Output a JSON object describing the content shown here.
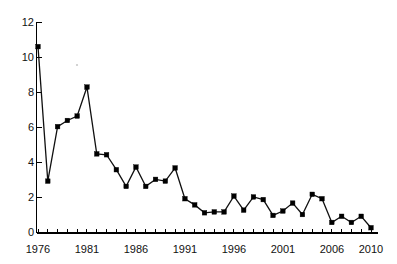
{
  "chart_data": {
    "type": "line",
    "title": "",
    "subtitle": "",
    "xlabel": "",
    "ylabel": "",
    "xlim": [
      1975.4,
      2010.6
    ],
    "ylim": [
      0,
      12
    ],
    "grid": false,
    "legend": null,
    "marker": "square",
    "line_color": "#101010",
    "marker_color": "#000000",
    "y_ticks": [
      0,
      2,
      4,
      6,
      8,
      10,
      12
    ],
    "y_tick_labels": [
      "0",
      "2",
      "4",
      "6",
      "8",
      "10",
      "12"
    ],
    "x_ticks": [
      1976,
      1977,
      1978,
      1979,
      1980,
      1981,
      1982,
      1983,
      1984,
      1985,
      1986,
      1987,
      1988,
      1989,
      1990,
      1991,
      1992,
      1993,
      1994,
      1995,
      1996,
      1997,
      1998,
      1999,
      2000,
      2001,
      2002,
      2003,
      2004,
      2005,
      2006,
      2007,
      2008,
      2009,
      2010
    ],
    "x_tick_labels_shown": [
      "1976",
      "1981",
      "1986",
      "1991",
      "1996",
      "2001",
      "2006",
      "2010"
    ],
    "x": [
      1976,
      1977,
      1978,
      1979,
      1980,
      1981,
      1982,
      1983,
      1984,
      1985,
      1986,
      1987,
      1988,
      1989,
      1990,
      1991,
      1992,
      1993,
      1994,
      1995,
      1996,
      1997,
      1998,
      1999,
      2000,
      2001,
      2002,
      2003,
      2004,
      2005,
      2006,
      2007,
      2008,
      2009,
      2010
    ],
    "values": [
      10.6,
      2.95,
      6.05,
      6.4,
      6.65,
      8.3,
      4.5,
      4.45,
      3.6,
      2.65,
      3.75,
      2.65,
      3.05,
      2.95,
      3.7,
      1.95,
      1.6,
      1.15,
      1.2,
      1.2,
      2.1,
      1.3,
      2.05,
      1.9,
      1.0,
      1.25,
      1.7,
      1.05,
      2.2,
      1.95,
      0.6,
      0.95,
      0.6,
      0.95,
      0.3
    ],
    "series": [
      {
        "name": "rate",
        "values": [
          10.6,
          2.95,
          6.05,
          6.4,
          6.65,
          8.3,
          4.5,
          4.45,
          3.6,
          2.65,
          3.75,
          2.65,
          3.05,
          2.95,
          3.7,
          1.95,
          1.6,
          1.15,
          1.2,
          1.2,
          2.1,
          1.3,
          2.05,
          1.9,
          1.0,
          1.25,
          1.7,
          1.05,
          2.2,
          1.95,
          0.6,
          0.95,
          0.6,
          0.95,
          0.3
        ]
      }
    ]
  },
  "axes": {
    "y_tick_labels": [
      "12",
      "10",
      "8",
      "6",
      "4",
      "2",
      "0"
    ],
    "x_tick_labels": [
      "1976",
      "1981",
      "1986",
      "1991",
      "1996",
      "2001",
      "2006",
      "2010"
    ]
  }
}
